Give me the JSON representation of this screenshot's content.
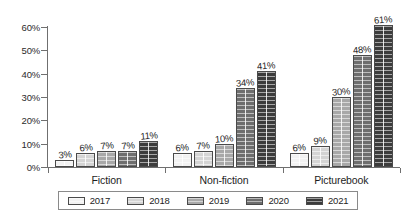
{
  "chart_data": {
    "type": "bar",
    "title": "",
    "subtitle": "",
    "xlabel": "",
    "ylabel": "",
    "categories": [
      "Fiction",
      "Non-fiction",
      "Picturebook"
    ],
    "series": [
      {
        "name": "2017",
        "values": [
          3,
          6,
          6
        ],
        "color": "#f2f2f2"
      },
      {
        "name": "2018",
        "values": [
          6,
          7,
          9
        ],
        "color": "#d4d4d4"
      },
      {
        "name": "2019",
        "values": [
          7,
          10,
          30
        ],
        "color": "#a8a8a8"
      },
      {
        "name": "2020",
        "values": [
          7,
          34,
          48
        ],
        "color": "#6e6e6e"
      },
      {
        "name": "2021",
        "values": [
          11,
          41,
          61
        ],
        "color": "#3c3c3c"
      }
    ],
    "data_labels": [
      [
        "3%",
        "6%",
        "7%",
        "7%",
        "11%"
      ],
      [
        "6%",
        "7%",
        "10%",
        "34%",
        "41%"
      ],
      [
        "6%",
        "9%",
        "30%",
        "48%",
        "61%"
      ]
    ],
    "ylim": [
      0,
      60
    ],
    "yticks": [
      0,
      10,
      20,
      30,
      40,
      50,
      60
    ],
    "ytick_labels": [
      "0%",
      "10%",
      "20%",
      "30%",
      "40%",
      "50%",
      "60%"
    ],
    "grid": false,
    "legend_position": "bottom",
    "value_unit": "%"
  }
}
